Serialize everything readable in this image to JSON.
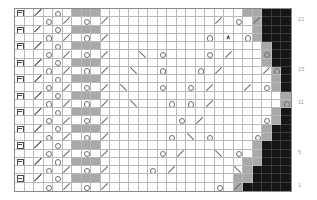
{
  "chart_data": {
    "type": "table",
    "grid": {
      "rows": 22,
      "cols": 29
    },
    "legend": {
      "o": "yarn-over",
      "/": "knit-two-together",
      "\\": "slip-slip-knit",
      "B": "bobble",
      "A": "centered-double-decrease",
      "#": "no-stitch",
      ".": "knit"
    },
    "row_labels": [
      {
        "text": "21",
        "row_index": 1
      },
      {
        "text": "15",
        "row_index": 7
      },
      {
        "text": "11",
        "row_index": 11
      },
      {
        "text": "5",
        "row_index": 17
      },
      {
        "text": "1",
        "row_index": 21
      }
    ],
    "colors": {
      "white": "#ffffff",
      "gray": "#a9a9a9",
      "light_gray": "#d0d0d0",
      "black": "#161616",
      "gridline": "#b9b9b9",
      "border": "#8a8a8a",
      "label": "#9a9a9a"
    },
    "fills": [
      "WWWWWWGGGWWWWWWWWWWWWWWWGGKKK",
      "WWWWWWWWWWWWWWWWWWWWWWWWWGKKK",
      "WWWWWWGGGWWWWWWWWWWWWWWWWGKKK",
      "WWWWWWWWWWWWWWWWWWWWWWWWWGKKK",
      "WWWWWWGGGWWWWWWWWWWWWWWWWWGKK",
      "WWWWWWWWWWWWWWWWWWWWWWWWWWGKK",
      "WWWWWWGGGWWWWWWWWWWWWWWWWWGKK",
      "WWWWWWWWWWWWWWWWWWWWWWWWWWWGK",
      "WWWWWWGGGWWWWWWWWWWWWWWWWWWGK",
      "WWWWWWWWWWWWWWWWWWWWWWWWWWWGK",
      "WWWWWWGGGWWWWWWWWWWWWWWWWWWWG",
      "WWWWWWWWWWWWWWWWWWWWWWWWWWWWG",
      "WWWWWWGGGWWWWWWWWWWWWWWWWWWGK",
      "WWWWWWWWWWWWWWWWWWWWWWWWWWWGK",
      "WWWWWWGGGWWWWWWWWWWWWWWWWWGKK",
      "WWWWWWWWWWWWWWWWWWWWWWWWWWGKK",
      "WWWWWWGGGWWWWWWWWWWWWWWWWGKKK",
      "WWWWWWWWWWWWWWWWWWWWWWWWWGKKK",
      "WWWWWWGGGWWWWWWWWWWWWWWWGGKKK",
      "WWWWWWWWWWWWWWWWWWWWWWWWGKKKK",
      "WWWWWWGGGWWWWWWWWWWWWWWGGKKKKK",
      "WWWWWWWWWWWWWWWWWWWWWWWGKKKKKK"
    ],
    "symbols": [
      "B.D.o........................B",
      "...o./.o./...........;.o./.B..",
      "B.D.o........................B",
      "...o./.o./..........o.A.o....B",
      "B.D.o........................B",
      "...o./.o./...\\.o....o./...o./B",
      "B.D.o........................B",
      "...o./.o./..\\..o...o./....;o.B",
      "B.D.o........................B",
      "...o./.o./.\\...o..o./...;.o./B",
      "B.D.o........................B",
      "...o./.o./..\\...o.o./.......oB",
      "B.D.o........................B",
      "...o./.o./.......o./......o..B",
      "B.D.o........................B",
      "...o./.o./......o.\\.o....o...B",
      "B.D.o........................B",
      "...o./.o./.....o./...\\.o..o..B",
      "B.D.o........................B",
      "...o./.o./....o./......\\.o..oB",
      "B.D.o........................B",
      "...o./.o./...........o./..B..."
    ]
  }
}
